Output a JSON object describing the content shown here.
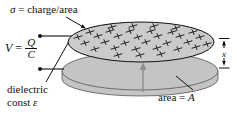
{
  "labels": {
    "sigma_symbol": "σ",
    "sigma_eq": " = charge/area",
    "v_prefix": "V",
    "v_eq": "=",
    "v_numerator": "Q",
    "v_denominator": "C",
    "dielectric_line1": "dielectric",
    "dielectric_line2_prefix": "const ",
    "dielectric_symbol": "ε",
    "area_prefix": "area = ",
    "area_symbol": "A",
    "separation_symbol": "x"
  },
  "colors": {
    "top_plate_fill": "#cbcbcb",
    "bottom_disk_fill": "#c4c4c4",
    "outline": "#111111",
    "disk_outline": "#555555",
    "gray_arrow": "#8c8c8c",
    "charge_mark": "#222222",
    "background": "#ffffff"
  },
  "charge_marks": [
    [
      112,
      27
    ],
    [
      133,
      26
    ],
    [
      154,
      26
    ],
    [
      176,
      28
    ],
    [
      90,
      32
    ],
    [
      110,
      31
    ],
    [
      130,
      31
    ],
    [
      151,
      31
    ],
    [
      172,
      32
    ],
    [
      193,
      32
    ],
    [
      78,
      37
    ],
    [
      98,
      36
    ],
    [
      118,
      36
    ],
    [
      138,
      37
    ],
    [
      158,
      36
    ],
    [
      180,
      36
    ],
    [
      200,
      37
    ],
    [
      85,
      43
    ],
    [
      105,
      42
    ],
    [
      125,
      43
    ],
    [
      146,
      42
    ],
    [
      167,
      43
    ],
    [
      188,
      42
    ],
    [
      207,
      44
    ],
    [
      95,
      49
    ],
    [
      115,
      48
    ],
    [
      136,
      49
    ],
    [
      157,
      48
    ],
    [
      178,
      49
    ],
    [
      196,
      47
    ],
    [
      118,
      55
    ],
    [
      140,
      55
    ],
    [
      161,
      54
    ]
  ]
}
